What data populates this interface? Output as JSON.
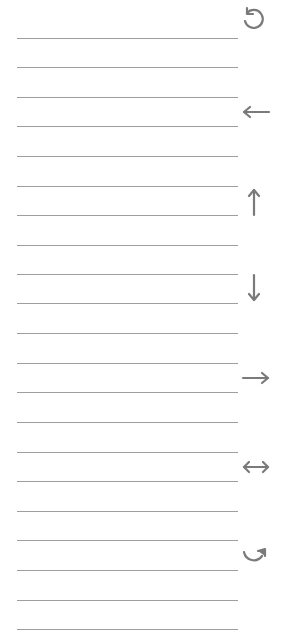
{
  "sheet": {
    "line_color": "#9e9e9e",
    "line_left": 17,
    "line_right": 238,
    "line_ys": [
      38,
      67,
      97,
      126,
      156,
      186,
      215,
      245,
      274,
      303,
      333,
      363,
      392,
      422,
      452,
      481,
      511,
      540,
      570,
      600,
      629
    ]
  },
  "icons": {
    "color": "#7a7a7a",
    "items": [
      {
        "name": "rotate-counterclockwise-icon",
        "cx": 253,
        "cy": 19
      },
      {
        "name": "arrow-left-icon",
        "cx": 256,
        "cy": 112
      },
      {
        "name": "arrow-up-icon",
        "cx": 254,
        "cy": 202
      },
      {
        "name": "arrow-down-icon",
        "cx": 254,
        "cy": 288
      },
      {
        "name": "arrow-right-icon",
        "cx": 256,
        "cy": 378
      },
      {
        "name": "arrow-left-right-icon",
        "cx": 256,
        "cy": 467
      },
      {
        "name": "rotate-clockwise-icon",
        "cx": 255,
        "cy": 557
      }
    ]
  }
}
